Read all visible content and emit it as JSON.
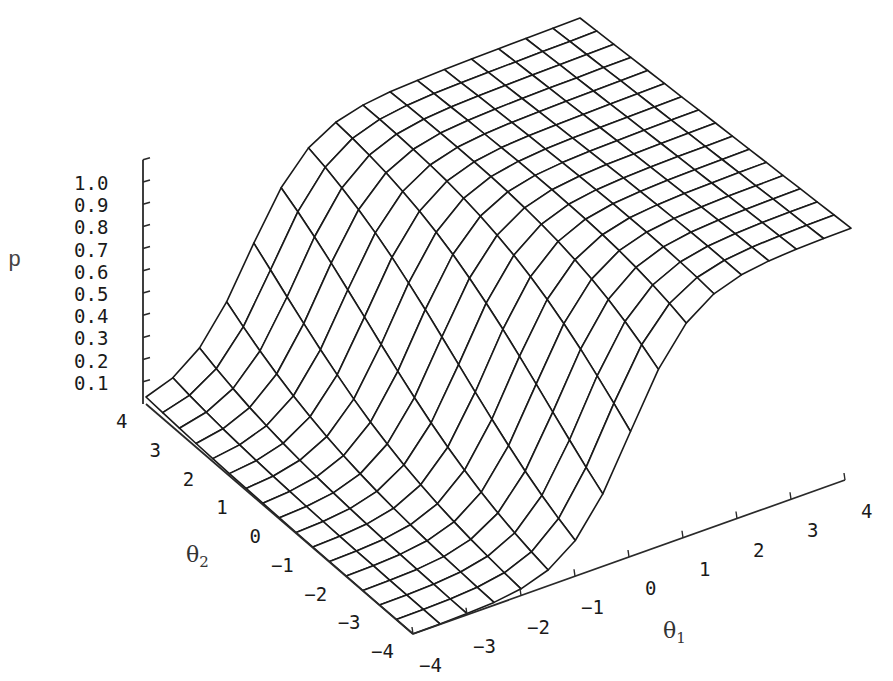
{
  "chart_data": {
    "type": "surface3d",
    "title": "",
    "zlabel": "p",
    "xlabel": "θ1",
    "ylabel": "θ2",
    "x_axis": {
      "name": "theta1",
      "label_main": "θ",
      "label_sub": "1",
      "range": [
        -4,
        4
      ],
      "ticks": [
        -4,
        -3,
        -2,
        -1,
        0,
        1,
        2,
        3,
        4
      ]
    },
    "y_axis": {
      "name": "theta2",
      "label_main": "θ",
      "label_sub": "2",
      "range": [
        -4,
        4
      ],
      "ticks": [
        4,
        3,
        2,
        1,
        0,
        -1,
        -2,
        -3,
        -4
      ]
    },
    "z_axis": {
      "name": "p",
      "label": "p",
      "range": [
        0,
        1
      ],
      "ticks": [
        "1.0",
        "0.9",
        "0.8",
        "0.7",
        "0.6",
        "0.5",
        "0.4",
        "0.3",
        "0.2",
        "0.1"
      ]
    },
    "surface": {
      "function": "p = 1 / (1 + exp(-(a1*θ1 + a2*θ2 + d)))",
      "a1": 1.8,
      "a2": 0.47,
      "d": 1.9,
      "grid_step": 0.5,
      "mesh": "wireframe, hidden lines removed"
    },
    "sample_values": [
      {
        "theta1": -4,
        "theta2": 4,
        "p": 0.02
      },
      {
        "theta1": -4,
        "theta2": -4,
        "p": 0.0
      },
      {
        "theta1": -2,
        "theta2": -4,
        "p": 0.01
      },
      {
        "theta1": 0,
        "theta2": -4,
        "p": 0.52
      },
      {
        "theta1": 2,
        "theta2": -4,
        "p": 0.98
      },
      {
        "theta1": 4,
        "theta2": -4,
        "p": 1.0
      },
      {
        "theta1": -2,
        "theta2": 4,
        "p": 0.55
      },
      {
        "theta1": 0,
        "theta2": 4,
        "p": 0.98
      },
      {
        "theta1": 4,
        "theta2": 4,
        "p": 1.0
      }
    ],
    "grid": false,
    "legend": "none"
  },
  "projection": {
    "base_corners": {
      "m4_p4": [
        146,
        404
      ],
      "m4_m4": [
        413,
        634
      ],
      "p4_m4": [
        845,
        480
      ],
      "p4_p4": [
        574,
        250
      ]
    },
    "z_scale": {
      "m4_p4": 222,
      "m4_m4": 245,
      "p4_m4": 252,
      "p4_p4": 232
    }
  },
  "colors": {
    "mesh": "#1a1a1a",
    "axis": "#2a2a2a",
    "background": "#ffffff",
    "surface_fill": "#ffffff"
  }
}
